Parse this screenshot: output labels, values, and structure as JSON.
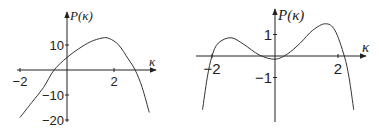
{
  "chart_data": [
    {
      "type": "line",
      "title": "",
      "xlabel": "κ",
      "ylabel": "P(κ)",
      "xlim": [
        -2.0,
        3.6
      ],
      "ylim": [
        -20,
        15
      ],
      "x_ticks": [
        -2,
        2
      ],
      "x_tick_labels": [
        "-2",
        "2"
      ],
      "y_ticks": [
        10,
        -10,
        -20
      ],
      "y_tick_labels": [
        "10",
        "-10",
        "-20"
      ],
      "grid": false,
      "legend": null,
      "series": [
        {
          "name": "P(κ)",
          "x": [
            -2.0,
            -1.5,
            -1.0,
            -0.55,
            0.0,
            0.5,
            1.0,
            1.5,
            1.8,
            2.2,
            2.6,
            2.9,
            3.2,
            3.5
          ],
          "y": [
            -19,
            -13,
            -7,
            0,
            5,
            8.5,
            11.3,
            12.8,
            12.6,
            10,
            4.5,
            0,
            -7,
            -17
          ]
        }
      ]
    },
    {
      "type": "line",
      "title": "",
      "xlabel": "κ",
      "ylabel": "P(κ)",
      "xlim": [
        -2.3,
        2.5
      ],
      "ylim": [
        -2.5,
        1.7
      ],
      "x_ticks": [
        -2,
        2
      ],
      "x_tick_labels": [
        "-2",
        "2"
      ],
      "y_ticks": [
        1,
        -1
      ],
      "y_tick_labels": [
        "1",
        "-1"
      ],
      "grid": false,
      "legend": null,
      "series": [
        {
          "name": "P(κ)",
          "x": [
            -2.3,
            -2.15,
            -2.0,
            -1.8,
            -1.4,
            -1.0,
            -0.5,
            0.0,
            0.4,
            0.8,
            1.2,
            1.6,
            1.9,
            2.2,
            2.35,
            2.5
          ],
          "y": [
            -2.5,
            -1.0,
            0.0,
            0.6,
            0.85,
            0.55,
            0.05,
            -0.15,
            0.1,
            0.6,
            1.2,
            1.5,
            1.2,
            0.0,
            -1.0,
            -2.5
          ]
        }
      ]
    }
  ]
}
